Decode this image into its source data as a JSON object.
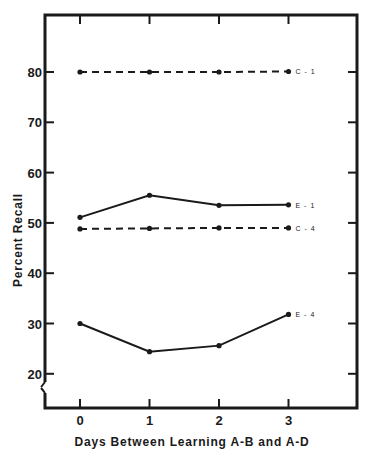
{
  "chart_data": {
    "type": "line",
    "title": "",
    "xlabel": "Days Between Learning A-B and A-D",
    "ylabel": "Percent Recall",
    "x": [
      0,
      1,
      2,
      3
    ],
    "categories": [
      "0",
      "1",
      "2",
      "3"
    ],
    "yticks": [
      20,
      30,
      40,
      50,
      60,
      70,
      80
    ],
    "ylim": [
      15,
      90
    ],
    "axis_break": true,
    "grid": false,
    "legend_position": "inline-right-of-last-point",
    "series": [
      {
        "name": "C-1",
        "style": "dashed",
        "values": [
          80.0,
          80.0,
          80.0,
          80.1
        ]
      },
      {
        "name": "E-1",
        "style": "solid",
        "values": [
          51.1,
          55.5,
          53.5,
          53.6
        ]
      },
      {
        "name": "C-4",
        "style": "dashed",
        "values": [
          48.8,
          48.9,
          49.0,
          49.0
        ]
      },
      {
        "name": "E-4",
        "style": "solid",
        "values": [
          30.0,
          24.4,
          25.6,
          31.8
        ]
      }
    ]
  },
  "colors": {
    "ink": "#1a1a1a",
    "background": "#ffffff"
  }
}
